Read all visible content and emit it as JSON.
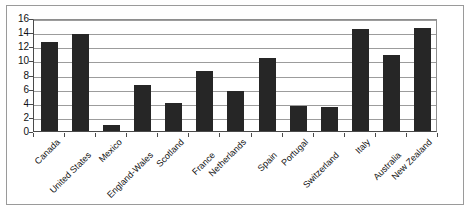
{
  "chart_data": {
    "type": "bar",
    "title": "",
    "subtitle": "",
    "xlabel": "",
    "ylabel": "",
    "ylim": [
      0,
      16
    ],
    "ytick_step": 2,
    "yticks": [
      "0",
      "2",
      "4",
      "6",
      "8",
      "10",
      "12",
      "14",
      "16"
    ],
    "grid": true,
    "legend": "none",
    "bar_color": "#262626",
    "gridline_color": "#9c9c9c",
    "axis_color": "#4a4a4a",
    "frame_color": "#9a9a9a",
    "categories": [
      "Canada",
      "United States",
      "Mexico",
      "England-Wales",
      "Scotland",
      "France",
      "Netherlands",
      "Spain",
      "Portugal",
      "Switzerland",
      "Italy",
      "Australia",
      "New Zealand"
    ],
    "values": [
      12.6,
      13.7,
      0.9,
      6.5,
      4.0,
      8.5,
      5.6,
      10.4,
      3.5,
      3.4,
      14.5,
      10.8,
      14.6
    ],
    "series": [
      {
        "name": "",
        "values": [
          12.6,
          13.7,
          0.9,
          6.5,
          4.0,
          8.5,
          5.6,
          10.4,
          3.5,
          3.4,
          14.5,
          10.8,
          14.6
        ]
      }
    ]
  }
}
